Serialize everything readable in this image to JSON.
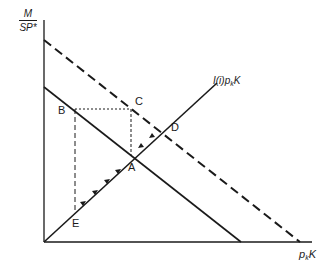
{
  "diagram": {
    "y_axis_label": {
      "numerator": "M",
      "denominator": "SP*"
    },
    "x_axis_label": {
      "base": "p",
      "sub": "k",
      "tail": "K"
    },
    "curve_label": {
      "prefix": "I(i)p",
      "sub": "k",
      "tail": "K"
    },
    "points": {
      "A": "A",
      "B": "B",
      "C": "C",
      "D": "D",
      "E": "E"
    },
    "colors": {
      "ink": "#1a1a1a",
      "background": "#ffffff"
    }
  }
}
